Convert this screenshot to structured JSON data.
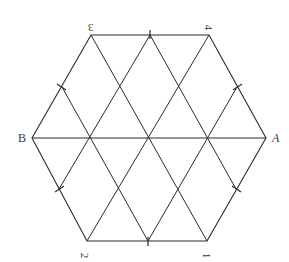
{
  "diagram": {
    "shape": "regular-hexagon-triangular-grid",
    "stroke_color": "#2a2a2a",
    "background": "#ffffff",
    "vertices": [
      {
        "id": "B",
        "label": "B",
        "x": 32,
        "y": 138
      },
      {
        "id": "3",
        "label": "3",
        "x": 91,
        "y": 35
      },
      {
        "id": "4",
        "label": "4",
        "x": 209,
        "y": 35
      },
      {
        "id": "A",
        "label": "A",
        "x": 266,
        "y": 138
      },
      {
        "id": "1",
        "label": "1",
        "x": 207,
        "y": 241
      },
      {
        "id": "2",
        "label": "2",
        "x": 87,
        "y": 241
      }
    ],
    "center": {
      "x": 149,
      "y": 138
    },
    "labels": {
      "three": "3",
      "four": "4",
      "A": "A",
      "B": "B",
      "one": "1",
      "two": "2"
    }
  }
}
